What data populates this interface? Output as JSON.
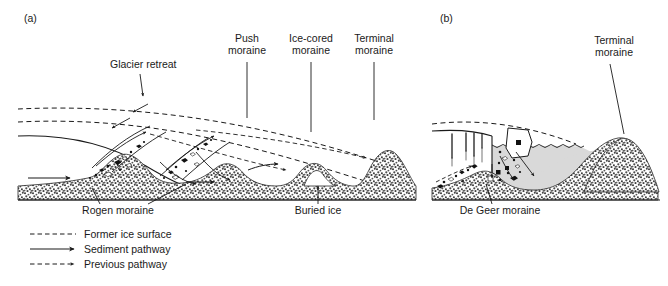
{
  "figure": {
    "background_color": "#ffffff",
    "line_color": "#1a1a1a",
    "sediment_fill_color": "#4a4a4a",
    "water_fill_color": "#d8d8d8",
    "ice_fill_color": "#ffffff"
  },
  "panels": [
    {
      "key": "a",
      "label": "(a)",
      "setting": "terrestrial ice margin",
      "labels": [
        {
          "key": "glacier-retreat",
          "text": "Glacier retreat"
        },
        {
          "key": "push-moraine",
          "line1": "Push",
          "line2": "moraine"
        },
        {
          "key": "ice-cored-moraine",
          "line1": "Ice-cored",
          "line2": "moraine"
        },
        {
          "key": "terminal-moraine",
          "line1": "Terminal",
          "line2": "moraine"
        },
        {
          "key": "rogen-moraine",
          "text": "Rogen moraine"
        },
        {
          "key": "buried-ice",
          "text": "Buried ice"
        }
      ]
    },
    {
      "key": "b",
      "label": "(b)",
      "setting": "aquatic ice margin",
      "labels": [
        {
          "key": "terminal-moraine",
          "line1": "Terminal",
          "line2": "moraine"
        },
        {
          "key": "de-geer-moraine",
          "text": "De Geer moraine"
        }
      ]
    }
  ],
  "legend": {
    "items": [
      {
        "key": "former-ice-surface",
        "label": "Former ice surface",
        "style": "dashed",
        "arrow": false
      },
      {
        "key": "sediment-pathway",
        "label": "Sediment pathway",
        "style": "solid",
        "arrow": true
      },
      {
        "key": "previous-pathway",
        "label": "Previous pathway",
        "style": "dashed",
        "arrow": true
      }
    ]
  }
}
